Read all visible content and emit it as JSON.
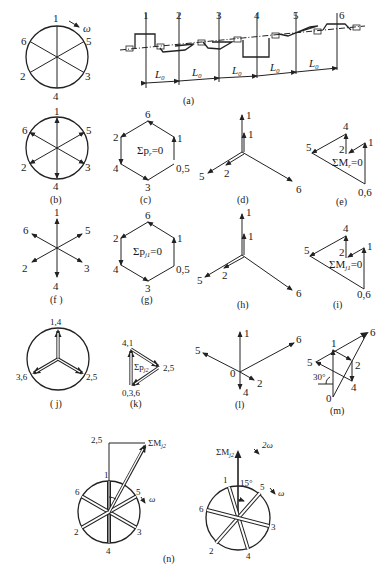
{
  "figure": {
    "panels": {
      "a_crank_circle": {
        "crank_labels": [
          "1",
          "5",
          "3",
          "4",
          "2",
          "6"
        ],
        "rotation_label": "ω"
      },
      "a_crankshaft": {
        "throw_labels": [
          "1",
          "2",
          "3",
          "4",
          "5",
          "6"
        ],
        "spacing_labels": [
          "L₀",
          "L₀",
          "L₀",
          "L₀",
          "L₀"
        ],
        "caption": "(a)"
      },
      "b": {
        "labels": [
          "1",
          "5",
          "3",
          "4",
          "2",
          "6"
        ],
        "caption": "(b)"
      },
      "c": {
        "labels": [
          "6",
          "1",
          "0,5",
          "3",
          "4",
          "2"
        ],
        "equation": "Σp",
        "equation_sub": "r",
        "equation_rhs": "=0",
        "caption": "(c)"
      },
      "d": {
        "labels": [
          "1",
          "1",
          "5",
          "2",
          "6"
        ],
        "caption": "(d)"
      },
      "e": {
        "labels": [
          "4",
          "1",
          "5",
          "2",
          "0,6"
        ],
        "equation": "ΣM",
        "equation_sub": "r",
        "equation_rhs": "=0",
        "caption": "(e)"
      },
      "f": {
        "labels": [
          "1",
          "5",
          "3",
          "4",
          "2",
          "6"
        ],
        "caption": "(f )"
      },
      "g": {
        "labels": [
          "6",
          "1",
          "0,5",
          "3",
          "4",
          "2"
        ],
        "equation": "Σp",
        "equation_sub": "j1",
        "equation_rhs": "=0",
        "caption": "(g)"
      },
      "h": {
        "labels": [
          "1",
          "1",
          "5",
          "2",
          "6"
        ],
        "caption": "(h)"
      },
      "i": {
        "labels": [
          "4",
          "1",
          "5",
          "2",
          "0,6"
        ],
        "equation": "ΣM",
        "equation_sub": "j1",
        "equation_rhs": "=0",
        "caption": "(i)"
      },
      "j": {
        "labels": [
          "1,4",
          "2,5",
          "3,6"
        ],
        "caption": "( j)"
      },
      "k": {
        "labels": [
          "4,1",
          "2,5",
          "0,3,6"
        ],
        "equation": "Σp",
        "equation_sub": "j2",
        "caption": "(k)"
      },
      "l": {
        "labels": [
          "1",
          "6",
          "5",
          "0",
          "2",
          "4"
        ],
        "caption": "(l)"
      },
      "m": {
        "labels": [
          "6",
          "1",
          "5",
          "2",
          "4",
          "0"
        ],
        "angle": "30°",
        "caption": "(m)"
      },
      "n_left": {
        "labels": [
          "2,5",
          "1",
          "5",
          "6",
          "2",
          "3",
          "4"
        ],
        "moment": "ΣM",
        "moment_sub": "j2",
        "rotation": "ω"
      },
      "n_right": {
        "labels": [
          "1",
          "5",
          "6",
          "3",
          "2",
          "4"
        ],
        "moment": "ΣM",
        "moment_sub": "j2",
        "angle": "15°",
        "rotation_outer": "2ω",
        "rotation_inner": "ω"
      },
      "n_caption": "(n)"
    }
  }
}
